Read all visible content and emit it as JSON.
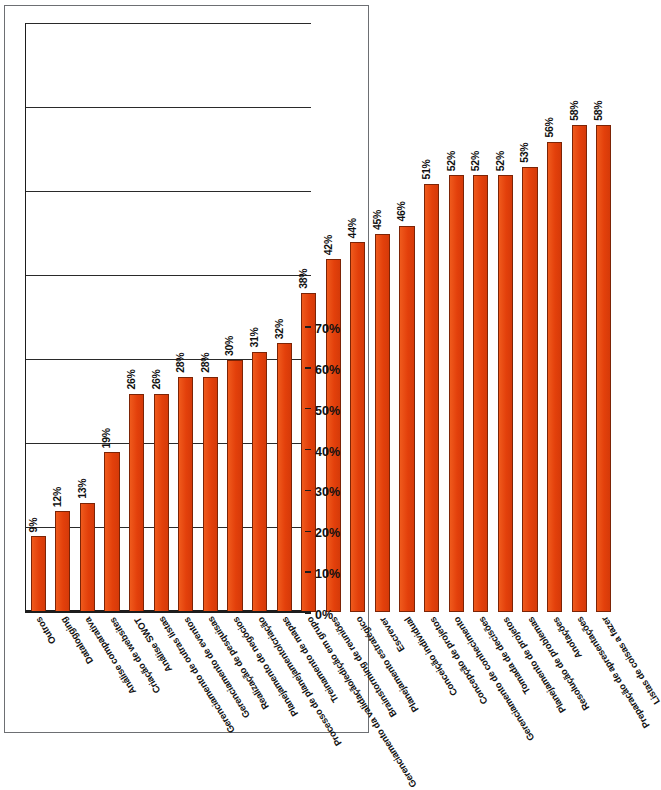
{
  "chart_data": {
    "type": "bar",
    "orientation": "horizontal",
    "title": "",
    "subtitle": "",
    "xlabel": "",
    "ylabel": "",
    "xlim": [
      0,
      70
    ],
    "xticks": [
      "0%",
      "10%",
      "20%",
      "30%",
      "40%",
      "50%",
      "60%",
      "70%"
    ],
    "xtick_values": [
      0,
      10,
      20,
      30,
      40,
      50,
      60,
      70
    ],
    "grid": true,
    "legend": false,
    "value_suffix": "%",
    "bar_color": "#e8430d",
    "bar_edge_color": "#7c2406",
    "axis_color": "#1d1d1d",
    "categories": [
      "Listas de coisas a fazer",
      "Preparação de apresentações",
      "Anotações",
      "Resolução de problemas",
      "Planejamento de projetos",
      "Tomada de decisões",
      "Gerenciamento de conhecimento",
      "Concepção de projetos",
      "Conceição individual",
      "Escrever",
      "Planejamento estratégico",
      "Brainstorming de reuniões",
      "Gerenciamento da validação/edição em grupo",
      "Treinamento de mapas",
      "Processo de planejamento/criação",
      "Planejamento de negócios",
      "Realização de pesquisas",
      "Gerenciamento de eventos",
      "Gerenciamento de outras listas",
      "Análise SWOT",
      "Criação de websites",
      "Análise comparativa",
      "Datalogging",
      "Outros"
    ],
    "values": [
      58,
      58,
      56,
      53,
      52,
      52,
      52,
      51,
      46,
      45,
      44,
      42,
      38,
      32,
      31,
      30,
      28,
      28,
      26,
      26,
      19,
      13,
      12,
      9
    ],
    "value_labels": [
      "58%",
      "58%",
      "56%",
      "53%",
      "52%",
      "52%",
      "52%",
      "51%",
      "46%",
      "45%",
      "44%",
      "42%",
      "38%",
      "32%",
      "31%",
      "30%",
      "28%",
      "28%",
      "26%",
      "26%",
      "19%",
      "13%",
      "12%",
      "9%"
    ]
  }
}
